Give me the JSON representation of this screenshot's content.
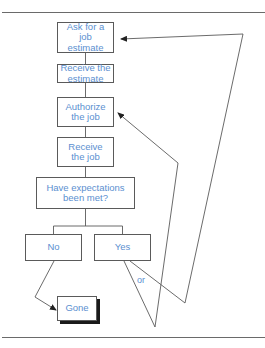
{
  "colors": {
    "text": "#5b8fd0",
    "line": "#5a5a5a"
  },
  "flowchart": {
    "nodes": [
      {
        "id": "ask",
        "label": "Ask for a job estimate",
        "lines": [
          "Ask for a",
          "job",
          "estimate"
        ]
      },
      {
        "id": "receive-estimate",
        "label": "Receive the estimate",
        "lines": [
          "Receive the",
          "estimate"
        ]
      },
      {
        "id": "authorize",
        "label": "Authorize the job",
        "lines": [
          "Authorize",
          "the job"
        ]
      },
      {
        "id": "receive-job",
        "label": "Receive the job",
        "lines": [
          "Receive",
          "the job"
        ]
      },
      {
        "id": "decision",
        "label": "Have expectations been met?",
        "lines": [
          "Have expectations",
          "been met?"
        ]
      },
      {
        "id": "no",
        "label": "No",
        "lines": [
          "No"
        ]
      },
      {
        "id": "yes",
        "label": "Yes",
        "lines": [
          "Yes"
        ]
      },
      {
        "id": "gone",
        "label": "Gone",
        "lines": [
          "Gone"
        ]
      }
    ],
    "or_label": "or"
  }
}
